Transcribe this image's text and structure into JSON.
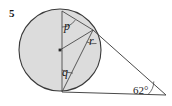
{
  "figure": {
    "question_number": "5",
    "caption": "",
    "colors": {
      "circle_fill": "#dcdcdc",
      "stroke": "#3a3a3a",
      "label_text": "#1a1a1a",
      "background": "#ffffff"
    }
  },
  "labels": {
    "angle_p": "p",
    "angle_q": "q",
    "angle_r": "r",
    "angle_apex": "62°"
  },
  "geometry": {
    "circle": {
      "cx": 60,
      "cy": 50,
      "r": 41
    },
    "points": {
      "center": {
        "x": 60,
        "y": 50
      },
      "top": {
        "x": 62,
        "y": 11
      },
      "bottom": {
        "x": 62,
        "y": 92
      },
      "tangent_upper": {
        "x": 93,
        "y": 30
      },
      "apex": {
        "x": 166,
        "y": 95
      }
    },
    "segments": [
      {
        "name": "diameter-top-bottom",
        "from": "top",
        "to": "bottom"
      },
      {
        "name": "chord-top-tangent-upper",
        "from": "top",
        "to": "tangent_upper"
      },
      {
        "name": "chord-bottom-tangent-upper",
        "from": "bottom",
        "to": "tangent_upper"
      },
      {
        "name": "radius-center-tangent-upper",
        "from": "center",
        "to": "tangent_upper"
      },
      {
        "name": "tangent-upper-to-apex",
        "from": "tangent_upper",
        "to": "apex"
      },
      {
        "name": "tangent-bottom-to-apex",
        "from": "bottom",
        "to": "apex"
      }
    ],
    "angle_arcs": [
      {
        "name": "arc-p",
        "vertex": "top"
      },
      {
        "name": "arc-q",
        "vertex": "bottom"
      },
      {
        "name": "arc-r",
        "vertex": "tangent_upper"
      },
      {
        "name": "arc-apex",
        "vertex": "apex"
      }
    ]
  }
}
